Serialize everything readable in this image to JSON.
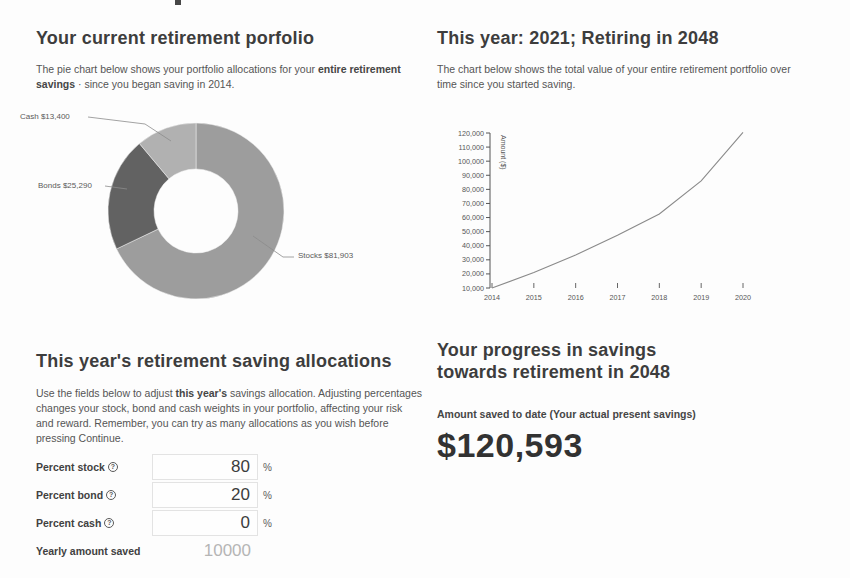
{
  "page": {
    "top_left": {
      "heading": "Your current retirement porfolio",
      "description_pre": "The pie chart below shows your portfolio allocations for your ",
      "description_bold": "entire retirement savings",
      "description_post": " · since you began saving in 2014."
    },
    "top_right": {
      "heading": "This year: 2021; Retiring in 2048",
      "description": "The chart below shows the total value of your entire retirement portfolio over time since you started saving."
    },
    "bottom_left": {
      "heading": "This year's retirement saving allocations",
      "description_pre": "Use the fields below to adjust ",
      "description_bold": "this year's",
      "description_post": " savings allocation. Adjusting percentages changes your stock, bond and cash weights in your portfolio, affecting your risk and reward. Remember, you can try as many allocations as you wish before pressing Continue.",
      "fields": [
        {
          "label": "Percent stock",
          "value": "80",
          "suffix": "%",
          "has_help": true
        },
        {
          "label": "Percent bond",
          "value": "20",
          "suffix": "%",
          "has_help": true
        },
        {
          "label": "Percent cash",
          "value": "0",
          "suffix": "%",
          "has_help": true
        },
        {
          "label": "Yearly amount saved",
          "value": "10000",
          "suffix": "",
          "has_help": false
        }
      ]
    },
    "bottom_right": {
      "heading": "Your progress in savings towards retirement in 2048",
      "amount_label": "Amount saved to date (Your actual present savings)",
      "amount_value": "$120,593"
    }
  },
  "icons": {
    "help_glyph": "?"
  },
  "chart_data": [
    {
      "type": "pie",
      "title": "Your current retirement porfolio",
      "donut": true,
      "segments": [
        {
          "name": "Stocks",
          "value": 81903,
          "label": "Stocks $81,903",
          "color": "#9d9d9d"
        },
        {
          "name": "Bonds",
          "value": 25290,
          "label": "Bonds $25,290",
          "color": "#626262"
        },
        {
          "name": "Cash",
          "value": 13400,
          "label": "Cash $13,400",
          "color": "#b1b1b1"
        }
      ],
      "total": 120593,
      "start_angle_deg_from_top": 0,
      "direction": "clockwise"
    },
    {
      "type": "line",
      "title": "This year: 2021; Retiring in 2048",
      "x": [
        2014,
        2015,
        2016,
        2017,
        2018,
        2019,
        2020
      ],
      "values": [
        10000,
        21000,
        33500,
        47500,
        62500,
        86000,
        120500
      ],
      "xlabel": "",
      "ylabel": "Amount ($)",
      "ylim": [
        10000,
        120000
      ],
      "ytick_step": 10000,
      "grid": false,
      "legend": false,
      "line_color": "#8a8a8a",
      "axis_color": "#555555"
    }
  ]
}
